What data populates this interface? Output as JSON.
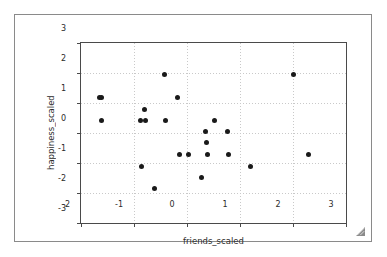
{
  "figure": {
    "background_color": "#ffffff",
    "border_color": "#8a8a8a",
    "axes_border_color": "#4a4a4a",
    "grid_color": "#c9c9c9",
    "marker_color": "#1a1a1a",
    "resize_grip_icon": "resize-grip-icon"
  },
  "chart_data": {
    "type": "scatter",
    "title": "",
    "xlabel": "friends_scaled",
    "ylabel": "happiness_scaled",
    "xlim": [
      -2,
      3
    ],
    "ylim": [
      -3,
      3
    ],
    "xticks": [
      -2,
      -1,
      0,
      1,
      2,
      3
    ],
    "yticks": [
      -3,
      -2,
      -1,
      0,
      1,
      2,
      3
    ],
    "xticklabels": [
      "-2",
      "-1",
      "0",
      "1",
      "2",
      "3"
    ],
    "yticklabels": [
      "-3",
      "-2",
      "-1",
      "0",
      "1",
      "2",
      "3"
    ],
    "grid": true,
    "legend": null,
    "marker": "o",
    "marker_size": 5,
    "points": [
      {
        "x": -1.66,
        "y": 1.17
      },
      {
        "x": -1.62,
        "y": 1.17
      },
      {
        "x": -1.62,
        "y": 0.42
      },
      {
        "x": -0.88,
        "y": 0.42
      },
      {
        "x": -0.8,
        "y": 0.79
      },
      {
        "x": -0.78,
        "y": 0.42
      },
      {
        "x": -0.86,
        "y": -1.11
      },
      {
        "x": -0.62,
        "y": -1.85
      },
      {
        "x": -0.42,
        "y": 1.94
      },
      {
        "x": -0.4,
        "y": 0.42
      },
      {
        "x": -0.18,
        "y": 1.17
      },
      {
        "x": -0.14,
        "y": -0.73
      },
      {
        "x": 0.02,
        "y": -0.73
      },
      {
        "x": 0.27,
        "y": -1.47
      },
      {
        "x": 0.35,
        "y": 0.04
      },
      {
        "x": 0.37,
        "y": -0.33
      },
      {
        "x": 0.38,
        "y": -0.73
      },
      {
        "x": 0.51,
        "y": 0.42
      },
      {
        "x": 0.77,
        "y": 0.04
      },
      {
        "x": 0.79,
        "y": -0.73
      },
      {
        "x": 1.2,
        "y": -1.11
      },
      {
        "x": 2.0,
        "y": 1.94
      },
      {
        "x": 2.3,
        "y": -0.73
      }
    ]
  }
}
